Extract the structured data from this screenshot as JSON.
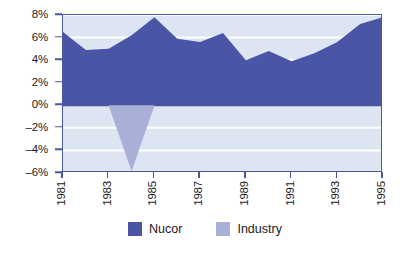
{
  "chart_data": {
    "type": "area",
    "title": "",
    "subtitle": "",
    "xlabel": "",
    "ylabel": "",
    "x": [
      1981,
      1982,
      1983,
      1984,
      1985,
      1986,
      1987,
      1988,
      1989,
      1990,
      1991,
      1992,
      1993,
      1994,
      1995
    ],
    "categories": [
      "1981",
      "1982",
      "1983",
      "1984",
      "1985",
      "1986",
      "1987",
      "1988",
      "1989",
      "1990",
      "1991",
      "1992",
      "1993",
      "1994",
      "1995"
    ],
    "series": [
      {
        "name": "Nucor",
        "color": "#4a55a5",
        "values": [
          6.5,
          4.9,
          5.0,
          6.2,
          7.8,
          5.9,
          5.6,
          6.4,
          4.0,
          4.8,
          3.9,
          4.6,
          5.6,
          7.2,
          7.8
        ]
      },
      {
        "name": "Industry",
        "color": "#a8b0d8",
        "values": [
          5.6,
          2.5,
          0.0,
          -5.8,
          0.0,
          1.8,
          1.8,
          4.2,
          3.3,
          3.9,
          3.5,
          2.0,
          2.5,
          0.2,
          0.0
        ]
      }
    ],
    "xlim": [
      1981,
      1995
    ],
    "ylim": [
      -6,
      8
    ],
    "ytick_values": [
      8,
      6,
      4,
      2,
      0,
      -2,
      -4,
      -6
    ],
    "ytick_labels": [
      "8%",
      "6%",
      "4%",
      "2%",
      "0%",
      "–2%",
      "–4%",
      "–6%"
    ],
    "xtick_values": [
      1981,
      1983,
      1985,
      1987,
      1989,
      1991,
      1993,
      1995
    ],
    "xtick_labels": [
      "1981",
      "1983",
      "1985",
      "1987",
      "1989",
      "1991",
      "1993",
      "1995"
    ],
    "grid": true,
    "grid_color": "#ffffff",
    "plot_background": "#dde4f2",
    "axis_color": "#4b55a0",
    "zero_line": 0,
    "legend_position": "bottom"
  },
  "legend": {
    "items": [
      {
        "label": "Nucor",
        "color": "#4a55a5"
      },
      {
        "label": "Industry",
        "color": "#a8b0d8"
      }
    ]
  }
}
